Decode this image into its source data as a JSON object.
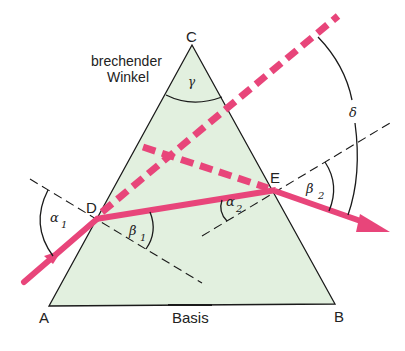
{
  "colors": {
    "prism_fill": "#e2f0df",
    "ray": "#e8457a",
    "line": "#1a1a1a",
    "background": "#ffffff"
  },
  "vertices": {
    "A": {
      "label": "A",
      "x": 49,
      "y": 306
    },
    "B": {
      "label": "B",
      "x": 335,
      "y": 304
    },
    "C": {
      "label": "C",
      "x": 192,
      "y": 45
    },
    "D": {
      "label": "D",
      "x": 97,
      "y": 218
    },
    "E": {
      "label": "E",
      "x": 275,
      "y": 191
    }
  },
  "labels": {
    "refracting_angle_line1": "brechender",
    "refracting_angle_line2": "Winkel",
    "base": "Basis",
    "gamma": "γ",
    "delta": "δ",
    "alpha1": "α",
    "alpha1_sub": "1",
    "beta1": "β",
    "beta1_sub": "1",
    "alpha2": "α",
    "alpha2_sub": "2",
    "beta2": "β",
    "beta2_sub": "2"
  }
}
